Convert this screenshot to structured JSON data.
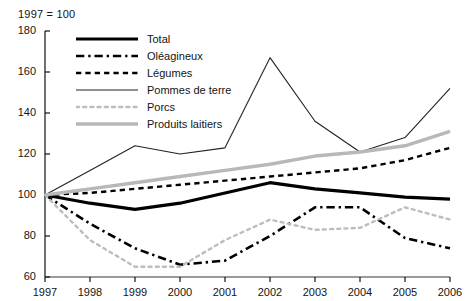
{
  "subtitle": "1997 = 100",
  "chart_data": {
    "type": "line",
    "title": "",
    "subtitle": "1997 = 100",
    "xlabel": "",
    "ylabel": "",
    "x": [
      1997,
      1998,
      1999,
      2000,
      2001,
      2002,
      2003,
      2004,
      2005,
      2006
    ],
    "categories": [
      "1997",
      "1998",
      "1999",
      "2000",
      "2001",
      "2002",
      "2003",
      "2004",
      "2005",
      "2006"
    ],
    "xlim": [
      1997,
      2006
    ],
    "ylim": [
      60,
      180
    ],
    "yticks": [
      60,
      80,
      100,
      120,
      140,
      160,
      180
    ],
    "grid": false,
    "legend_position": "upper-left-inside",
    "series": [
      {
        "name": "Total",
        "color": "#000000",
        "style": "solid",
        "width": 3.2,
        "values": [
          100,
          96,
          93,
          96,
          101,
          106,
          103,
          101,
          99,
          98
        ]
      },
      {
        "name": "Oléagineux",
        "color": "#000000",
        "style": "dashdot",
        "width": 2.6,
        "values": [
          100,
          86,
          74,
          66,
          68,
          80,
          94,
          94,
          79,
          74
        ]
      },
      {
        "name": "Légumes",
        "color": "#000000",
        "style": "dashed",
        "width": 2.4,
        "values": [
          100,
          101,
          103,
          105,
          107,
          109,
          111,
          113,
          117,
          123
        ]
      },
      {
        "name": "Pommes de terre",
        "color": "#222222",
        "style": "solid",
        "width": 1.1,
        "values": [
          100,
          112,
          124,
          120,
          123,
          167,
          136,
          121,
          128,
          152
        ]
      },
      {
        "name": "Porcs",
        "color": "#bdbdbd",
        "style": "dotted",
        "width": 2.4,
        "values": [
          100,
          78,
          65,
          65,
          78,
          88,
          83,
          84,
          94,
          88
        ]
      },
      {
        "name": "Produits laitiers",
        "color": "#b8b8b8",
        "style": "solid",
        "width": 3.4,
        "values": [
          100,
          103,
          106,
          109,
          112,
          115,
          119,
          121,
          124,
          131
        ]
      }
    ]
  },
  "legend": {
    "items": [
      {
        "label": "Total",
        "key": "total"
      },
      {
        "label": "Oléagineux",
        "key": "oleagineux"
      },
      {
        "label": "Légumes",
        "key": "legumes"
      },
      {
        "label": "Pommes de terre",
        "key": "pommes-de-terre"
      },
      {
        "label": "Porcs",
        "key": "porcs"
      },
      {
        "label": "Produits laitiers",
        "key": "produits-laitiers"
      }
    ]
  },
  "axes": {
    "y_labels": [
      "180",
      "160",
      "140",
      "120",
      "100",
      "80",
      "60"
    ],
    "x_labels": [
      "1997",
      "1998",
      "1999",
      "2000",
      "2001",
      "2002",
      "2003",
      "2004",
      "2005",
      "2006"
    ]
  }
}
